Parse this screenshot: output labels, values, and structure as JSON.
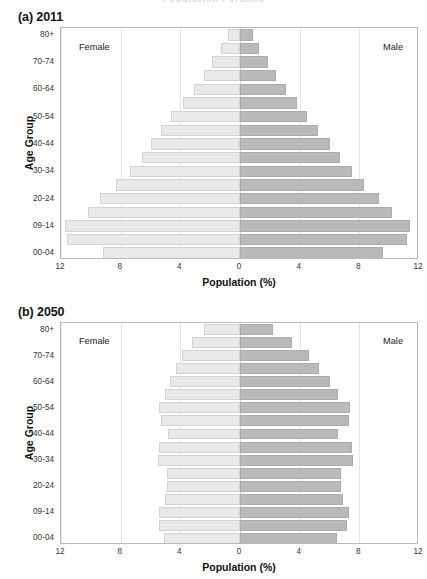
{
  "page": {
    "top_fragment": "Population Pyramid"
  },
  "panels": [
    {
      "title": "(a) 2011",
      "female_label": "Female",
      "male_label": "Male",
      "y_axis_title": "Age Group",
      "x_axis_title": "Population (%)"
    },
    {
      "title": "(b) 2050",
      "female_label": "Female",
      "male_label": "Male",
      "y_axis_title": "Age Group",
      "x_axis_title": "Population (%)"
    }
  ],
  "colors": {
    "female_fill": "#e9e9e9",
    "male_fill": "#b9b9b9",
    "axis": "#b9b9b9",
    "grid": "#e4e4e4"
  },
  "chart_data": [
    {
      "type": "bar",
      "title": "(a) 2011",
      "subtitle": "",
      "xlabel": "Population (%)",
      "ylabel": "Age Group",
      "xlim": [
        -12,
        12
      ],
      "xticks": [
        12,
        8,
        4,
        0,
        4,
        8,
        12
      ],
      "xtick_values": [
        -12,
        -8,
        -4,
        0,
        4,
        8,
        12
      ],
      "grid": true,
      "legend_position": "in-plot-corners",
      "orientation": "population-pyramid",
      "categories": [
        "00-04",
        "05-08",
        "09-14",
        "15-19",
        "20-24",
        "25-29",
        "30-34",
        "35-39",
        "40-44",
        "45-49",
        "50-54",
        "55-59",
        "60-64",
        "65-69",
        "70-74",
        "75-79",
        "80+"
      ],
      "ytick_labels": [
        "00-04",
        "",
        "09-14",
        "",
        "20-24",
        "",
        "30-34",
        "",
        "40-44",
        "",
        "50-54",
        "",
        "60-64",
        "",
        "70-74",
        "",
        "80+"
      ],
      "series": [
        {
          "name": "Female",
          "side": "left",
          "values": [
            9.2,
            11.6,
            11.7,
            10.2,
            9.4,
            8.3,
            7.4,
            6.6,
            6.0,
            5.3,
            4.6,
            3.8,
            3.1,
            2.4,
            1.9,
            1.3,
            0.8
          ]
        },
        {
          "name": "Male",
          "side": "right",
          "values": [
            9.6,
            11.2,
            11.4,
            10.2,
            9.3,
            8.3,
            7.5,
            6.7,
            6.0,
            5.2,
            4.5,
            3.8,
            3.1,
            2.4,
            1.9,
            1.3,
            0.9
          ]
        }
      ]
    },
    {
      "type": "bar",
      "title": "(b) 2050",
      "subtitle": "",
      "xlabel": "Population (%)",
      "ylabel": "Age Group",
      "xlim": [
        -12,
        12
      ],
      "xticks": [
        12,
        8,
        4,
        0,
        4,
        8,
        12
      ],
      "xtick_values": [
        -12,
        -8,
        -4,
        0,
        4,
        8,
        12
      ],
      "grid": true,
      "legend_position": "in-plot-corners",
      "orientation": "population-pyramid",
      "categories": [
        "00-04",
        "05-08",
        "09-14",
        "15-19",
        "20-24",
        "25-29",
        "30-34",
        "35-39",
        "40-44",
        "45-49",
        "50-54",
        "55-59",
        "60-64",
        "65-69",
        "70-74",
        "75-79",
        "80+"
      ],
      "ytick_labels": [
        "00-04",
        "",
        "09-14",
        "",
        "20-24",
        "",
        "30-34",
        "",
        "40-44",
        "",
        "50-54",
        "",
        "60-64",
        "",
        "70-74",
        "",
        "80+"
      ],
      "series": [
        {
          "name": "Female",
          "side": "left",
          "values": [
            5.1,
            5.4,
            5.4,
            5.0,
            4.9,
            4.9,
            5.5,
            5.4,
            4.8,
            5.3,
            5.4,
            5.0,
            4.7,
            4.3,
            3.9,
            3.2,
            2.4
          ]
        },
        {
          "name": "Male",
          "side": "right",
          "values": [
            6.5,
            7.2,
            7.3,
            6.9,
            6.8,
            6.8,
            7.6,
            7.5,
            6.6,
            7.3,
            7.4,
            6.6,
            6.0,
            5.3,
            4.6,
            3.5,
            2.2
          ]
        }
      ]
    }
  ]
}
